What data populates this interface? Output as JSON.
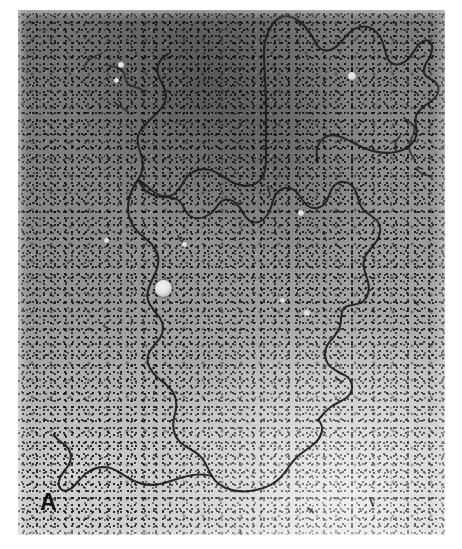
{
  "figure": {
    "kind": "electron-micrograph",
    "modality": "transmission electron microscopy",
    "panel_label": "A",
    "background_tone_hex": "#9a9a9a",
    "filament_color_hex": "#1d1d1d",
    "label_color_hex": "#111111",
    "page_background_hex": "#ffffff",
    "plate": {
      "left_px": 18,
      "top_px": 10,
      "width_px": 427,
      "height_px": 525
    },
    "features": [
      {
        "name": "dna-main-strand",
        "description": "long continuous dark filament winding from upper right through central loops to lower left free end"
      },
      {
        "name": "bright-particle",
        "description": "small bright round bead on the filament left of centre",
        "x_px": 145,
        "y_px": 278,
        "diameter_px": 17
      },
      {
        "name": "dark-gradient-band",
        "description": "darker exposure band across upper centre-left of the plate"
      },
      {
        "name": "short-fragment-upper-left",
        "description": "short squiggly filament fragment upper left"
      },
      {
        "name": "short-fragment-right-edge",
        "description": "short squiggly filament fragment near right edge"
      }
    ],
    "strand_paths": {
      "main": "M 223 8 C 226 18, 224 26, 220 34 C 216 42, 212 48, 214 56 C 218 66, 228 62, 234 56 C 242 48, 248 40, 258 36 C 270 31, 282 34, 292 38 C 304 43, 316 47, 328 44 C 340 41, 348 33, 352 24 C 356 15, 358 8, 362 4 M 362 4 C 370 10, 376 20, 378 32 C 380 44, 378 56, 372 66 C 366 76, 356 84, 358 94 C 360 104, 372 106, 378 112 C 384 118, 382 128, 374 136 C 366 144, 354 150, 342 152 C 330 154, 318 152, 308 146 C 298 140, 292 130, 290 120 M 223 8 C 220 2, 216 0, 212 0 M 212 0 C 206 6, 202 14, 202 24 C 202 44, 203 70, 203 96 C 203 122, 203 150, 204 176 C 205 190, 206 196, 200 200 C 192 205, 180 204, 170 200 C 158 195, 148 186, 138 180 C 128 174, 118 172, 110 178 C 102 184, 100 194, 98 202 C 96 212, 92 218, 84 220 C 74 222, 64 218, 56 212 C 48 206, 42 200, 36 198"
    }
  }
}
